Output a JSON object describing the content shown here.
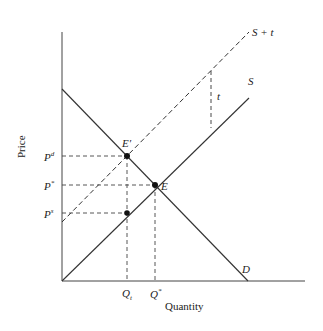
{
  "diagram": {
    "type": "supply-demand tax incidence",
    "axes": {
      "x_label": "Quantity",
      "y_label": "Price"
    },
    "curves": [
      {
        "name": "D",
        "style": "solid",
        "label": "D"
      },
      {
        "name": "S",
        "style": "solid",
        "label": "S"
      },
      {
        "name": "S + t",
        "style": "dashed",
        "label": "S + t"
      }
    ],
    "points": [
      {
        "label": "E",
        "desc": "original equilibrium"
      },
      {
        "label": "E′",
        "desc": "equilibrium with tax"
      }
    ],
    "price_labels": {
      "pd_base": "P",
      "pd_sup": "d",
      "pstar_base": "P",
      "pstar_sup": "*",
      "ps_base": "P",
      "ps_sup": "s"
    },
    "quantity_labels": {
      "qt_base": "Q",
      "qt_sub": "t",
      "qstar_base": "Q",
      "qstar_sup": "*"
    },
    "tax_label": "t"
  }
}
